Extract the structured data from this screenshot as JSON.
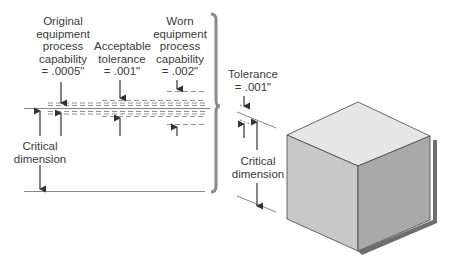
{
  "labels": {
    "original": [
      "Original",
      "equipment",
      "process",
      "capability",
      "= .0005\""
    ],
    "acceptable": [
      "Acceptable",
      "tolerance",
      "= .001\""
    ],
    "worn": [
      "Worn",
      "equipment",
      "process",
      "capability",
      "= .002\""
    ],
    "tolerance": [
      "Tolerance",
      "= .001\""
    ],
    "critical_left": [
      "Critical",
      "dimension"
    ],
    "critical_right": [
      "Critical",
      "dimension"
    ]
  },
  "colors": {
    "line": "#555555",
    "dash": "#777777",
    "brace": "#8a8a8a",
    "cube_top": "#e6e6e6",
    "cube_left": "#c8c8c8",
    "cube_right": "#a9a9a9",
    "cube_shadow": "#6e6e6e"
  }
}
